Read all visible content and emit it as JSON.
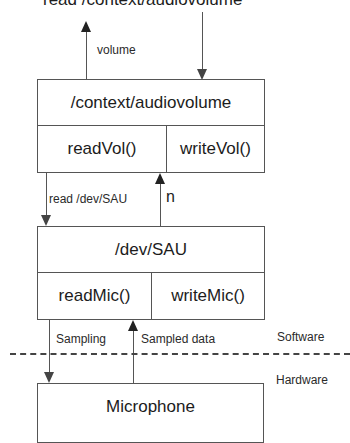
{
  "diagram": {
    "top_label": "read /context/audiovolume",
    "volume_label": "volume",
    "context_box": {
      "title": "/context/audiovolume",
      "methods": [
        "readVol()",
        "writeVol()"
      ]
    },
    "read_dev_label": "read /dev/SAU",
    "n_label": "n",
    "dev_box": {
      "title": "/dev/SAU",
      "methods": [
        "readMic()",
        "writeMic()"
      ]
    },
    "sampling_label": "Sampling",
    "sampled_data_label": "Sampled data",
    "software_label": "Software",
    "hardware_label": "Hardware",
    "microphone_box": {
      "title": "Microphone"
    }
  }
}
